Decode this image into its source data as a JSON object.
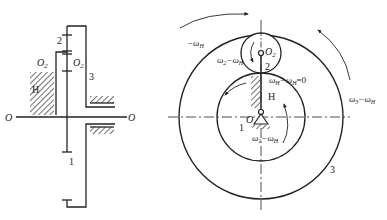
{
  "left_diagram": {
    "title": "Planetary gear train schematic",
    "labels": {
      "gear_2": "2",
      "planet_axis_left": "O",
      "planet_axis_left_sub": "2",
      "planet_axis_right": "O",
      "planet_axis_right_sub": "2",
      "ring_gear": "3",
      "carrier": "H",
      "sun_gear": "1",
      "axis_left": "O",
      "axis_right": "O"
    }
  },
  "right_diagram": {
    "title": "Relative motion (inversion) diagram",
    "labels": {
      "center_planet": "O",
      "center_planet_sub": "2",
      "planet_gear": "2",
      "carrier": "H",
      "center": "O",
      "sun_gear": "1",
      "ring_gear": "3",
      "neg_omega_h": "−ω",
      "neg_omega_h_sub": "H",
      "omega2_rel": "ω",
      "omega2_rel_sub1": "2",
      "omega2_rel_mid": "−ω",
      "omega2_rel_sub2": "H",
      "omegaH_rel": "ω",
      "omegaH_rel_sub1": "H",
      "omegaH_rel_mid": "−ω",
      "omegaH_rel_sub2": "H",
      "omegaH_rel_end": "=0",
      "omega1_rel": "ω",
      "omega1_rel_sub1": "1",
      "omega1_rel_mid": "−ω",
      "omega1_rel_sub2": "H",
      "omega3_rel": "ω",
      "omega3_rel_sub1": "3",
      "omega3_rel_mid": "−ω",
      "omega3_rel_sub2": "H"
    }
  },
  "colors": {
    "line": "#222222",
    "hatch": "#333333",
    "background": "#ffffff"
  }
}
